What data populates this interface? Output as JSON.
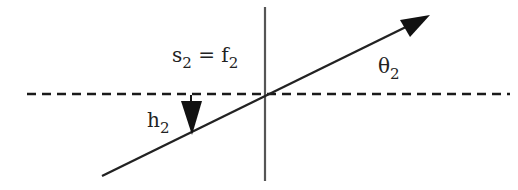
{
  "diagram": {
    "labels": {
      "s2_eq_f2": {
        "s": "s",
        "s_sub": "2",
        "eq": " = ",
        "f": "f",
        "f_sub": "2"
      },
      "theta2": {
        "base": "θ",
        "sub": "2"
      },
      "h2": {
        "base": "h",
        "sub": "2"
      }
    },
    "colors": {
      "line": "#1a1a1a",
      "vertical": "#555555"
    }
  }
}
